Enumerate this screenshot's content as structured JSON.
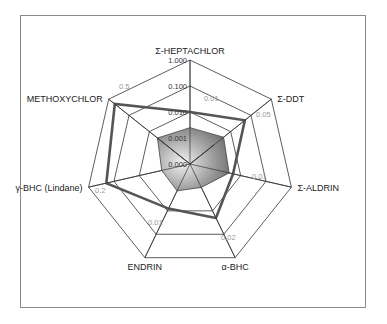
{
  "chart_data": {
    "type": "radar",
    "title": "",
    "scale": "log",
    "axes": [
      "Σ-HEPTACHLOR",
      "Σ-DDT",
      "Σ-ALDRIN",
      "α-BHC",
      "ENDRIN",
      "γ-BHC (Lindane)",
      "METHOXYCHLOR"
    ],
    "ring_tick_labels": [
      "0.000",
      "0.001",
      "0.010",
      "0.100",
      "1.000"
    ],
    "range": [
      0.0001,
      1.0
    ],
    "axis_annotations": [
      {
        "axis": "Σ-HEPTACHLOR",
        "label": "0.01"
      },
      {
        "axis": "Σ-DDT",
        "label": "0.05"
      },
      {
        "axis": "Σ-ALDRIN",
        "label": "0.01"
      },
      {
        "axis": "α-BHC",
        "label": "0.02"
      },
      {
        "axis": "ENDRIN",
        "label": "0.01"
      },
      {
        "axis": "γ-BHC (Lindane)",
        "label": "0.2"
      },
      {
        "axis": "METHOXYCHLOR",
        "label": "0.5"
      }
    ],
    "series": [
      {
        "name": "Series 1 (gray filled)",
        "style": "filled-gray",
        "values": [
          0.0025,
          0.0045,
          0.0035,
          0.001,
          0.0014,
          0.0013,
          0.004
        ]
      },
      {
        "name": "Series 2 (white inner)",
        "style": "filled-white",
        "values": [
          0.0001,
          0.0015,
          0.0001,
          0.0001,
          0.0001,
          0.0001,
          0.004
        ]
      },
      {
        "name": "Series 3 (thick outline)",
        "style": "thick-line",
        "values": [
          0.01,
          0.05,
          0.005,
          0.02,
          0.008,
          0.2,
          0.5
        ]
      }
    ],
    "legend": null,
    "grid": true
  },
  "colors": {
    "grid": "#333333",
    "fill_light": "#d8d8d8",
    "fill_dark": "#6e6e6e",
    "thick_line": "#555555",
    "frame": "#8a8a8a"
  }
}
